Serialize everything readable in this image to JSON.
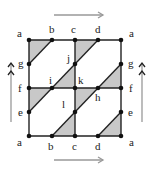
{
  "diagram": {
    "colors": {
      "line": "#222222",
      "shade": "#c8c8c8",
      "arrow": "#999999",
      "dot": "#111111"
    },
    "labels": {
      "top": [
        "a",
        "b",
        "c",
        "d",
        "a"
      ],
      "bottom": [
        "a",
        "b",
        "c",
        "d",
        "a"
      ],
      "left": [
        "g",
        "f",
        "e"
      ],
      "right": [
        "g",
        "f",
        "e"
      ],
      "interior": {
        "i": "i",
        "j": "j",
        "k": "k",
        "h": "h",
        "l": "l"
      }
    },
    "arrows": {
      "top": "single-right",
      "bottom": "single-right",
      "left": "double-up",
      "right": "double-up"
    }
  }
}
